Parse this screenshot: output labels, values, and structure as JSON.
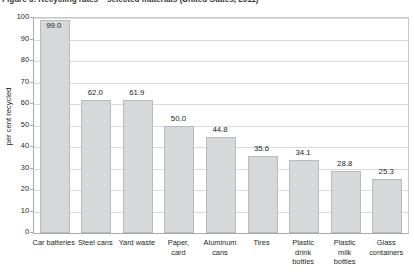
{
  "figure": {
    "title": "Figure 6: Recycling rates – selected materials (United States, 2011)"
  },
  "chart_data": {
    "type": "bar",
    "title": "Figure 6: Recycling rates – selected materials (United States, 2011)",
    "xlabel": "",
    "ylabel": "per cent recycled",
    "ylim": [
      0,
      100
    ],
    "ytick_step": 10,
    "ytick_labels": [
      "100",
      "90",
      "80",
      "70",
      "60",
      "50",
      "40",
      "30",
      "20",
      "10",
      "0"
    ],
    "grid": true,
    "legend": "none",
    "bar_color": "#d7d8d9",
    "bar_border_color": "#b9bbbd",
    "categories": [
      "Car batteries",
      "Steel cans",
      "Yard waste",
      "Paper,\ncard",
      "Aluminum\ncans",
      "Tires",
      "Plastic\ndrink\nbottles",
      "Plastic\nmilk\nbottles",
      "Glass\ncontainers"
    ],
    "category_lines": [
      [
        "Car batteries"
      ],
      [
        "Steel cans"
      ],
      [
        "Yard waste"
      ],
      [
        "Paper,",
        "card"
      ],
      [
        "Aluminum",
        "cans"
      ],
      [
        "Tires"
      ],
      [
        "Plastic",
        "drink",
        "bottles"
      ],
      [
        "Plastic",
        "milk",
        "bottles"
      ],
      [
        "Glass",
        "containers"
      ]
    ],
    "values": [
      99.0,
      62.0,
      61.9,
      50.0,
      44.8,
      35.6,
      34.1,
      28.8,
      25.3
    ],
    "value_labels": [
      "99.0",
      "62.0",
      "61.9",
      "50.0",
      "44.8",
      "35.6",
      "34.1",
      "28.8",
      "25.3"
    ]
  }
}
